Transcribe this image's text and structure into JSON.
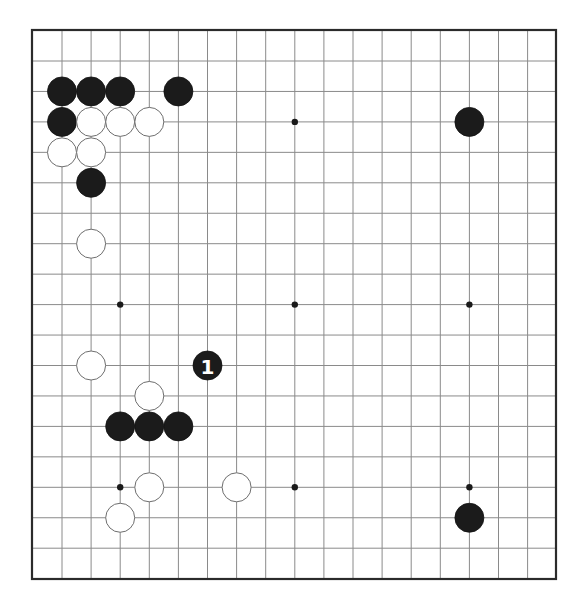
{
  "board": {
    "frame": {
      "left": 32,
      "top": 30,
      "right": 556,
      "bottom": 579
    },
    "columns": 17,
    "rows": 17,
    "origin": {
      "x": 62,
      "y": 61
    },
    "spacing": {
      "x": 29.1,
      "y": 30.45
    },
    "stone_radius": 14.5,
    "colors": {
      "border": "#2b2b2b",
      "grid": "#8a8a8a",
      "black_stone": "#1b1b1b",
      "white_stone": "#ffffff",
      "white_stone_outline": "#6e6e6e",
      "background": "#ffffff"
    },
    "hoshi": [
      [
        2,
        2
      ],
      [
        8,
        2
      ],
      [
        14,
        2
      ],
      [
        2,
        8
      ],
      [
        8,
        8
      ],
      [
        14,
        8
      ],
      [
        2,
        14
      ],
      [
        8,
        14
      ],
      [
        14,
        14
      ]
    ],
    "stones": {
      "black": [
        [
          0,
          1
        ],
        [
          1,
          1
        ],
        [
          2,
          1
        ],
        [
          4,
          1
        ],
        [
          0,
          2
        ],
        [
          14,
          2
        ],
        [
          1,
          4
        ],
        [
          2,
          12
        ],
        [
          3,
          12
        ],
        [
          4,
          12
        ],
        [
          14,
          15
        ]
      ],
      "white": [
        [
          1,
          2
        ],
        [
          2,
          2
        ],
        [
          3,
          2
        ],
        [
          0,
          3
        ],
        [
          1,
          3
        ],
        [
          1,
          6
        ],
        [
          1,
          10
        ],
        [
          3,
          11
        ],
        [
          3,
          14
        ],
        [
          6,
          14
        ],
        [
          2,
          15
        ]
      ]
    },
    "numbered_moves": [
      {
        "col": 5,
        "row": 10,
        "color": "black",
        "label": "1"
      }
    ]
  }
}
